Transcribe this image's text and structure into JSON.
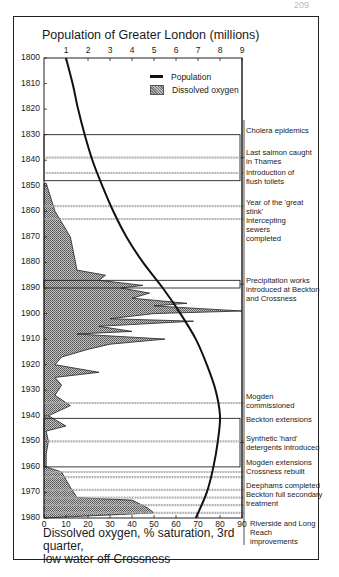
{
  "page": {
    "number": "209"
  },
  "chart_data": {
    "type": "area",
    "title_top_axis": "Population of Greater London (millions)",
    "xlabel_bottom": "Dissolved oxygen, % saturation, 3rd quarter, low water off Crossness",
    "ylabel": "Year",
    "y_axis": {
      "range": [
        1800,
        1980
      ],
      "ticks": [
        1800,
        1810,
        1820,
        1830,
        1840,
        1850,
        1860,
        1870,
        1880,
        1890,
        1900,
        1910,
        1920,
        1930,
        1940,
        1950,
        1960,
        1970,
        1980
      ],
      "inverted": true
    },
    "top_axis": {
      "label": "Population of Greater London (millions)",
      "range": [
        0,
        9
      ],
      "ticks": [
        1,
        2,
        3,
        4,
        5,
        6,
        7,
        8,
        9
      ]
    },
    "bottom_axis": {
      "label": "Dissolved oxygen, % saturation",
      "range": [
        0,
        90
      ],
      "ticks": [
        0,
        10,
        20,
        30,
        40,
        50,
        60,
        70,
        80,
        90
      ]
    },
    "legend": [
      {
        "name": "Population",
        "style": "line"
      },
      {
        "name": "Dissolved oxygen",
        "style": "hatched-area"
      }
    ],
    "series": [
      {
        "name": "Population",
        "axis": "top",
        "unit": "millions",
        "points": [
          {
            "year": 1800,
            "value": 1.0
          },
          {
            "year": 1810,
            "value": 1.3
          },
          {
            "year": 1820,
            "value": 1.55
          },
          {
            "year": 1830,
            "value": 1.85
          },
          {
            "year": 1840,
            "value": 2.2
          },
          {
            "year": 1850,
            "value": 2.65
          },
          {
            "year": 1860,
            "value": 3.15
          },
          {
            "year": 1870,
            "value": 3.75
          },
          {
            "year": 1880,
            "value": 4.5
          },
          {
            "year": 1890,
            "value": 5.4
          },
          {
            "year": 1900,
            "value": 6.2
          },
          {
            "year": 1910,
            "value": 6.9
          },
          {
            "year": 1920,
            "value": 7.4
          },
          {
            "year": 1930,
            "value": 7.8
          },
          {
            "year": 1940,
            "value": 8.0
          },
          {
            "year": 1950,
            "value": 7.9
          },
          {
            "year": 1960,
            "value": 7.7
          },
          {
            "year": 1970,
            "value": 7.4
          },
          {
            "year": 1980,
            "value": 6.9
          }
        ]
      },
      {
        "name": "Dissolved oxygen",
        "axis": "bottom",
        "unit": "% saturation",
        "points": [
          {
            "year": 1849,
            "value": 1
          },
          {
            "year": 1860,
            "value": 5
          },
          {
            "year": 1870,
            "value": 12
          },
          {
            "year": 1883,
            "value": 15
          },
          {
            "year": 1885,
            "value": 28
          },
          {
            "year": 1887,
            "value": 25
          },
          {
            "year": 1889,
            "value": 45
          },
          {
            "year": 1890,
            "value": 35
          },
          {
            "year": 1892,
            "value": 48
          },
          {
            "year": 1894,
            "value": 40
          },
          {
            "year": 1896,
            "value": 65
          },
          {
            "year": 1897,
            "value": 50
          },
          {
            "year": 1899,
            "value": 92
          },
          {
            "year": 1900,
            "value": 50
          },
          {
            "year": 1902,
            "value": 30
          },
          {
            "year": 1903,
            "value": 68
          },
          {
            "year": 1905,
            "value": 25
          },
          {
            "year": 1907,
            "value": 40
          },
          {
            "year": 1908,
            "value": 15
          },
          {
            "year": 1910,
            "value": 55
          },
          {
            "year": 1912,
            "value": 30
          },
          {
            "year": 1914,
            "value": 20
          },
          {
            "year": 1917,
            "value": 8
          },
          {
            "year": 1920,
            "value": 5
          },
          {
            "year": 1923,
            "value": 25
          },
          {
            "year": 1925,
            "value": 5
          },
          {
            "year": 1928,
            "value": 8
          },
          {
            "year": 1932,
            "value": 5
          },
          {
            "year": 1936,
            "value": 12
          },
          {
            "year": 1940,
            "value": 2
          },
          {
            "year": 1944,
            "value": 10
          },
          {
            "year": 1946,
            "value": 1
          },
          {
            "year": 1950,
            "value": 2
          },
          {
            "year": 1955,
            "value": 1
          },
          {
            "year": 1960,
            "value": 1
          },
          {
            "year": 1962,
            "value": 8
          },
          {
            "year": 1965,
            "value": 10
          },
          {
            "year": 1968,
            "value": 12
          },
          {
            "year": 1972,
            "value": 15
          },
          {
            "year": 1973,
            "value": 40
          },
          {
            "year": 1976,
            "value": 47
          },
          {
            "year": 1978,
            "value": 50
          }
        ]
      }
    ],
    "annotations": [
      {
        "year": 1830,
        "label": "Cholera epidemics",
        "marker": "bracket",
        "years": [
          1830,
          1848
        ]
      },
      {
        "year": 1839,
        "label": "Last salmon caught in Thames",
        "marker": "hatched-line"
      },
      {
        "year": 1845,
        "label": "Introduction of flush toilets",
        "marker": "hatched-line"
      },
      {
        "year": 1858,
        "label": "Year of the 'great stink'",
        "marker": "hatched-line"
      },
      {
        "year": 1863,
        "label": "Intercepting sewers completed",
        "marker": "hatched-line"
      },
      {
        "year": 1887,
        "label": "Precipitation works introduced at Beckton and Crossness",
        "marker": "bracket",
        "years": [
          1887,
          1890
        ]
      },
      {
        "year": 1935,
        "label": "Mogden commissioned",
        "marker": "hatched-line"
      },
      {
        "year": 1941,
        "label": "Beckton extensions",
        "marker": "bracket",
        "years": [
          1941,
          1960
        ]
      },
      {
        "year": 1950,
        "label": "Synthetic 'hard' detergents introduced",
        "marker": "hatched-line"
      },
      {
        "year": 1962,
        "label": "Mogden extensions",
        "marker": "hatched-line"
      },
      {
        "year": 1964,
        "label": "Crossness rebuilt",
        "marker": "hatched-line"
      },
      {
        "year": 1969,
        "label": "Deephams completed",
        "marker": "hatched-line"
      },
      {
        "year": 1972,
        "label": "Beckton full secondary treatment",
        "marker": "hatched-line"
      },
      {
        "year": 1975,
        "label": "Beckton full secondary treatment (cont.)",
        "marker": "hatched-line"
      },
      {
        "year": 1978,
        "label": "Riverside and Long Reach improvements",
        "marker": "hatched-line"
      }
    ]
  },
  "labels": {
    "title": "Population of Greater London (millions)",
    "xlabel_line1": "Dissolved oxygen, % saturation, 3rd quarter,",
    "xlabel_line2": "low water off Crossness",
    "legend_population": "Population",
    "legend_oxygen": "Dissolved oxygen",
    "ann": [
      "Cholera epidemics",
      "Last salmon caught in Thames",
      "Introduction of flush toilets",
      "Year of the 'great stink' Intercepting sewers completed",
      "Precipitation works introduced at Beckton and Crossness",
      "Mogden commissioned",
      "Beckton extensions",
      "Synthetic 'hard' detergents introduced",
      "Mogden extensions Crossness rebuilt",
      "Deephams completed Beckton full secondary treatment",
      "Riverside and Long Reach improvements"
    ],
    "years": [
      "1800",
      "1810",
      "1820",
      "1830",
      "1840",
      "1850",
      "1860",
      "1870",
      "1880",
      "1890",
      "1900",
      "1910",
      "1920",
      "1930",
      "1940",
      "1950",
      "1960",
      "1970",
      "1980"
    ],
    "pop_ticks": [
      "1",
      "2",
      "3",
      "4",
      "5",
      "6",
      "7",
      "8",
      "9"
    ],
    "oxy_ticks": [
      "0",
      "10",
      "20",
      "30",
      "40",
      "50",
      "60",
      "70",
      "80",
      "90"
    ]
  }
}
